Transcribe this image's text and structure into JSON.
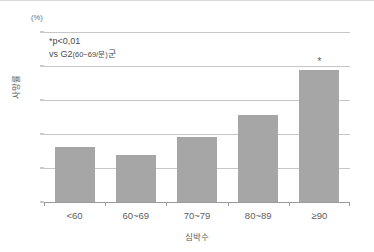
{
  "chart_data": {
    "type": "bar",
    "title": "",
    "subtitle": "",
    "unit_label": "(%)",
    "categories": [
      "<60",
      "60~69",
      "70~79",
      "80~89",
      "≥90"
    ],
    "values": [
      16.3,
      13.8,
      19.2,
      25.5,
      38.7
    ],
    "series": [
      {
        "name": "사망률",
        "values": [
          16.3,
          13.8,
          19.2,
          25.5,
          38.7
        ]
      }
    ],
    "xlabel": "심박수",
    "ylabel": "사망률",
    "ylim": [
      0,
      50
    ],
    "yticks": [
      0,
      10,
      20,
      30,
      40,
      50
    ],
    "ytick_labels": [
      "0",
      "10",
      "20",
      "30",
      "40",
      "50"
    ],
    "grid": true,
    "grid_axis": "y",
    "legend": false,
    "legend_position": "none",
    "bar_color": "#a6a6a6",
    "grid_color": "#c6c6c6",
    "axis_color": "#9a9a9a",
    "text_color": "#5e5e5e",
    "background_color": "#ffffff",
    "significance_markers": [
      {
        "category": "≥90",
        "marker": "*",
        "value": 38.7
      }
    ],
    "annotations": [
      {
        "id": "p-value",
        "text": "*p<0,01"
      },
      {
        "id": "comparison",
        "text_prefix": "vs G2",
        "text_small": "(60~69/분)",
        "text_suffix": "군"
      }
    ]
  }
}
